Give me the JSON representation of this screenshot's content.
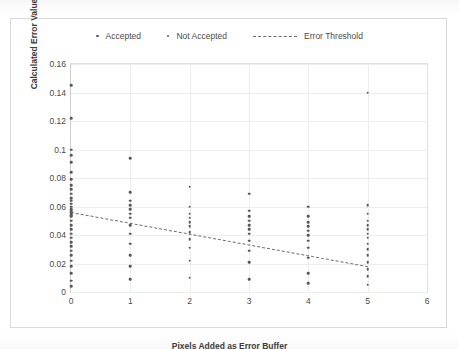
{
  "legend": {
    "items": [
      {
        "label": "Accepted",
        "marker": "dot",
        "color": "#585858"
      },
      {
        "label": "Not Accepted",
        "marker": "dot",
        "color": "#6e6e6e"
      },
      {
        "label": "Error Threshold",
        "marker": "dashed-line",
        "color": "#6f6f6f"
      }
    ]
  },
  "chart_data": {
    "type": "scatter",
    "title": "",
    "xlabel": "Pixels Added as Error Buffer",
    "ylabel": "Calculated Error Value",
    "xlim": [
      0,
      6
    ],
    "ylim": [
      0,
      0.16
    ],
    "xticks": [
      "0",
      "1",
      "2",
      "3",
      "4",
      "5",
      "6"
    ],
    "yticks": [
      "0",
      "0.02",
      "0.04",
      "0.06",
      "0.08",
      "0.1",
      "0.12",
      "0.14",
      "0.16"
    ],
    "grid": true,
    "legend_position": "top",
    "series": [
      {
        "name": "Accepted",
        "color": "#585858",
        "points": [
          [
            0,
            0.145
          ],
          [
            0,
            0.122
          ],
          [
            0,
            0.1
          ],
          [
            0,
            0.096
          ],
          [
            0,
            0.091
          ],
          [
            0,
            0.084
          ],
          [
            0,
            0.079
          ],
          [
            0,
            0.075
          ],
          [
            0,
            0.072
          ],
          [
            0,
            0.069
          ],
          [
            0,
            0.066
          ],
          [
            0,
            0.064
          ],
          [
            0,
            0.062
          ],
          [
            0,
            0.06
          ],
          [
            0,
            0.058
          ],
          [
            0,
            0.057
          ],
          [
            0,
            0.056
          ],
          [
            0,
            0.055
          ],
          [
            0,
            0.054
          ],
          [
            0,
            0.053
          ],
          [
            0,
            0.05
          ],
          [
            0,
            0.047
          ],
          [
            0,
            0.044
          ],
          [
            0,
            0.041
          ],
          [
            0,
            0.038
          ],
          [
            0,
            0.035
          ],
          [
            0,
            0.032
          ],
          [
            0,
            0.029
          ],
          [
            0,
            0.026
          ],
          [
            0,
            0.022
          ],
          [
            0,
            0.018
          ],
          [
            0,
            0.013
          ],
          [
            0,
            0.008
          ],
          [
            0,
            0.004
          ],
          [
            1,
            0.094
          ],
          [
            1,
            0.07
          ],
          [
            1,
            0.064
          ],
          [
            1,
            0.061
          ],
          [
            1,
            0.058
          ],
          [
            1,
            0.055
          ],
          [
            1,
            0.052
          ],
          [
            1,
            0.047
          ],
          [
            1,
            0.041
          ],
          [
            1,
            0.034
          ],
          [
            1,
            0.026
          ],
          [
            1,
            0.018
          ],
          [
            1,
            0.009
          ],
          [
            2,
            0.074
          ],
          [
            2,
            0.06
          ],
          [
            2,
            0.055
          ],
          [
            2,
            0.052
          ],
          [
            2,
            0.049
          ],
          [
            2,
            0.046
          ],
          [
            2,
            0.042
          ],
          [
            2,
            0.037
          ],
          [
            2,
            0.031
          ],
          [
            2,
            0.022
          ],
          [
            2,
            0.01
          ],
          [
            3,
            0.069
          ],
          [
            3,
            0.057
          ],
          [
            3,
            0.053
          ],
          [
            3,
            0.05
          ],
          [
            3,
            0.047
          ],
          [
            3,
            0.044
          ],
          [
            3,
            0.041
          ],
          [
            3,
            0.036
          ],
          [
            3,
            0.029
          ],
          [
            3,
            0.021
          ],
          [
            3,
            0.009
          ],
          [
            4,
            0.06
          ],
          [
            4,
            0.053
          ],
          [
            4,
            0.049
          ],
          [
            4,
            0.046
          ],
          [
            4,
            0.043
          ],
          [
            4,
            0.04
          ],
          [
            4,
            0.036
          ],
          [
            4,
            0.031
          ],
          [
            4,
            0.024
          ],
          [
            4,
            0.013
          ],
          [
            4,
            0.006
          ],
          [
            5,
            0.14
          ],
          [
            5,
            0.061
          ],
          [
            5,
            0.055
          ],
          [
            5,
            0.05
          ],
          [
            5,
            0.047
          ],
          [
            5,
            0.044
          ],
          [
            5,
            0.041
          ],
          [
            5,
            0.038
          ],
          [
            5,
            0.034
          ],
          [
            5,
            0.03
          ],
          [
            5,
            0.026
          ],
          [
            5,
            0.021
          ],
          [
            5,
            0.016
          ],
          [
            5,
            0.011
          ],
          [
            5,
            0.005
          ]
        ]
      }
    ],
    "threshold_line": {
      "name": "Error Threshold",
      "style": "dashed",
      "color": "#6f6f6f",
      "x": [
        0,
        5
      ],
      "y": [
        0.056,
        0.018
      ]
    }
  }
}
